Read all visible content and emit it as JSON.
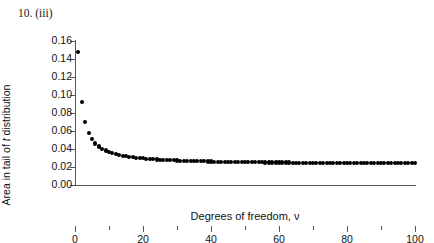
{
  "figure": {
    "label": "10. (iii)"
  },
  "chart_data": {
    "type": "scatter",
    "title": "10. (iii)",
    "xlabel": "Degrees of freedom, ν",
    "ylabel": "Area in tail of t distribution",
    "ylabel_parts": [
      "Area in tail of ",
      "t",
      " distribution"
    ],
    "xlim": [
      0,
      100
    ],
    "ylim": [
      0.0,
      0.16
    ],
    "xticks": [
      0,
      20,
      40,
      60,
      80,
      100
    ],
    "xtick_labels": [
      "0",
      "20",
      "40",
      "60",
      "80",
      "100"
    ],
    "xminor_ticks": [
      10,
      30,
      50,
      70,
      90
    ],
    "yticks": [
      0.0,
      0.02,
      0.04,
      0.06,
      0.08,
      0.1,
      0.12,
      0.14,
      0.16
    ],
    "ytick_labels": [
      "0.00",
      "0.02",
      "0.04",
      "0.06",
      "0.08",
      "0.10",
      "0.12",
      "0.14",
      "0.16"
    ],
    "grid": false,
    "legend": false,
    "marker": "filled-circle",
    "marker_color": "#000000",
    "x": [
      1,
      2,
      3,
      4,
      5,
      6,
      7,
      8,
      9,
      10,
      11,
      12,
      13,
      14,
      15,
      16,
      17,
      18,
      19,
      20,
      21,
      22,
      23,
      24,
      25,
      26,
      27,
      28,
      29,
      30,
      31,
      32,
      33,
      34,
      35,
      36,
      37,
      38,
      39,
      40,
      41,
      42,
      43,
      44,
      45,
      46,
      47,
      48,
      49,
      50,
      51,
      52,
      53,
      54,
      55,
      56,
      57,
      58,
      59,
      60,
      61,
      62,
      63,
      64,
      65,
      66,
      67,
      68,
      69,
      70,
      71,
      72,
      73,
      74,
      75,
      76,
      77,
      78,
      79,
      80,
      81,
      82,
      83,
      84,
      85,
      86,
      87,
      88,
      89,
      90,
      91,
      92,
      93,
      94,
      95,
      96,
      97,
      98,
      99,
      100
    ],
    "y": [
      0.1476,
      0.0918,
      0.0697,
      0.0581,
      0.051,
      0.0462,
      0.0428,
      0.0403,
      0.0383,
      0.0367,
      0.0354,
      0.0343,
      0.0334,
      0.0326,
      0.0319,
      0.0313,
      0.0308,
      0.0303,
      0.0299,
      0.0296,
      0.0292,
      0.0289,
      0.0286,
      0.0284,
      0.0281,
      0.0279,
      0.0277,
      0.0275,
      0.0274,
      0.0272,
      0.0271,
      0.0269,
      0.0268,
      0.0267,
      0.0266,
      0.0265,
      0.0264,
      0.0263,
      0.0262,
      0.0261,
      0.026,
      0.0259,
      0.0258,
      0.0258,
      0.0257,
      0.0256,
      0.0256,
      0.0255,
      0.0255,
      0.0254,
      0.0253,
      0.0253,
      0.0252,
      0.0252,
      0.0252,
      0.0251,
      0.0251,
      0.025,
      0.025,
      0.025,
      0.0249,
      0.0249,
      0.0249,
      0.0248,
      0.0248,
      0.0248,
      0.0247,
      0.0247,
      0.0247,
      0.0247,
      0.0246,
      0.0246,
      0.0246,
      0.0246,
      0.0245,
      0.0245,
      0.0245,
      0.0245,
      0.0245,
      0.0244,
      0.0244,
      0.0244,
      0.0244,
      0.0244,
      0.0243,
      0.0243,
      0.0243,
      0.0243,
      0.0243,
      0.0243,
      0.0242,
      0.0242,
      0.0242,
      0.0242,
      0.0242,
      0.0242,
      0.0242,
      0.0241,
      0.0241,
      0.0241
    ],
    "asymptote": 0.0228,
    "n_points": 100
  }
}
